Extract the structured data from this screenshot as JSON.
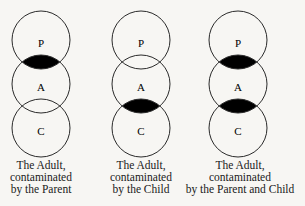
{
  "colors": {
    "background": "#f7f6f3",
    "stroke": "#2a2a2a",
    "contamination_fill": "#000000"
  },
  "diagram": {
    "circle_radius": 29,
    "circle_centers_y": [
      40,
      84,
      128
    ],
    "labels": [
      "P",
      "A",
      "C"
    ],
    "groups": [
      {
        "center_x": 41,
        "contaminated_overlaps": [
          "P-A"
        ],
        "caption": [
          "The Adult,",
          "contaminated",
          "by the Parent"
        ]
      },
      {
        "center_x": 141,
        "contaminated_overlaps": [
          "A-C"
        ],
        "caption": [
          "The Adult,",
          "contaminated",
          "by the Child"
        ]
      },
      {
        "center_x": 238,
        "contaminated_overlaps": [
          "P-A",
          "A-C"
        ],
        "caption": [
          "The Adult,",
          "contaminated",
          "by the Parent and Child"
        ]
      }
    ]
  }
}
